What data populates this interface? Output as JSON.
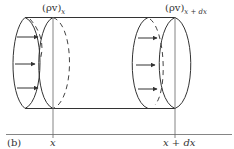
{
  "figure": {
    "panel_label": "(b)",
    "flux_in": {
      "base": "(ρv)",
      "subscript": "x"
    },
    "flux_out": {
      "base": "(ρv)",
      "subscript": "x + dx"
    },
    "axis_labels": {
      "left": "x",
      "right": "x + dx"
    },
    "colors": {
      "stroke": "#333333",
      "background": "#ffffff"
    }
  }
}
